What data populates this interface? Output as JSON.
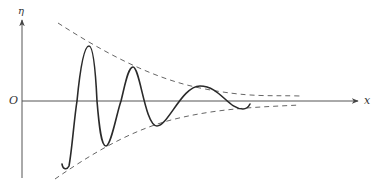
{
  "figure": {
    "labels": {
      "y_axis": "η",
      "x_axis": "x",
      "origin": "O"
    },
    "colors": {
      "axis": "#444444",
      "curve": "#2a2a2a",
      "envelope": "#555555",
      "background": "#ffffff"
    },
    "axes": {
      "origin_px": [
        22,
        101
      ],
      "y_axis_top_px": 20,
      "y_axis_bottom_px": 178,
      "x_axis_right_px": 358
    },
    "curve": {
      "style": "solid",
      "key_points_px": [
        {
          "name": "start-hook",
          "x": 62,
          "y": 164
        },
        {
          "name": "trough-1",
          "x": 68,
          "y": 168
        },
        {
          "name": "zero-1",
          "x": 77,
          "y": 101
        },
        {
          "name": "peak-1",
          "x": 89,
          "y": 46
        },
        {
          "name": "zero-2",
          "x": 97,
          "y": 101
        },
        {
          "name": "trough-2",
          "x": 106,
          "y": 146
        },
        {
          "name": "zero-3",
          "x": 121,
          "y": 101
        },
        {
          "name": "peak-2",
          "x": 133,
          "y": 67
        },
        {
          "name": "trough-3",
          "x": 157,
          "y": 126
        },
        {
          "name": "peak-3",
          "x": 200,
          "y": 86
        },
        {
          "name": "trough-4",
          "x": 243,
          "y": 109
        },
        {
          "name": "end",
          "x": 250,
          "y": 104
        }
      ]
    },
    "envelope": {
      "style": "dashed",
      "upper": {
        "start_px": [
          58,
          23
        ],
        "end_px": [
          300,
          96
        ]
      },
      "lower": {
        "start_px": [
          55,
          179
        ],
        "end_px": [
          300,
          105
        ]
      }
    }
  }
}
